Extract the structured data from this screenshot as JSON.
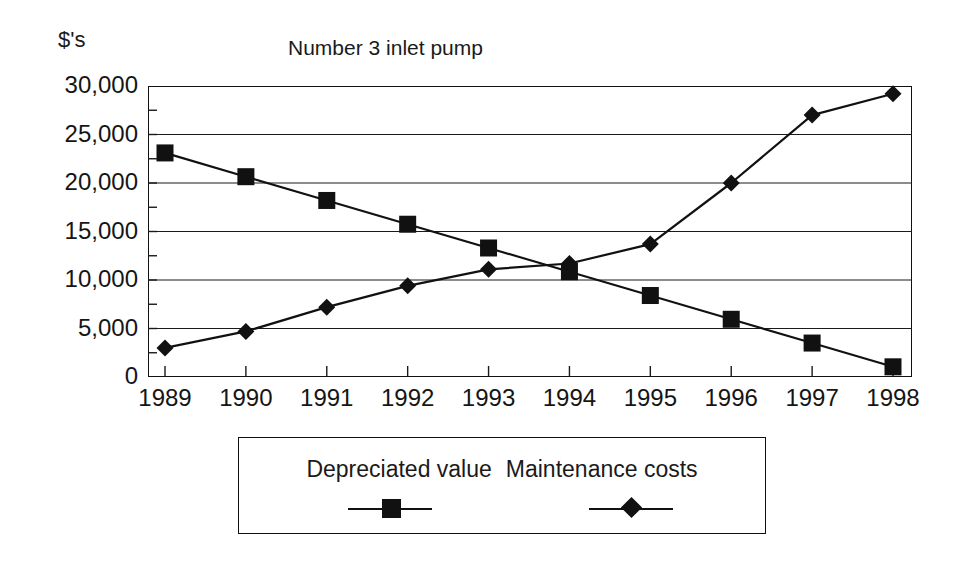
{
  "chart_data": {
    "type": "line",
    "title": "Number 3 inlet pump",
    "xlabel": "",
    "ylabel": "$'s",
    "ylim": [
      0,
      30000
    ],
    "xlim": [
      1989,
      1998
    ],
    "grid": true,
    "legend_position": "bottom",
    "categories": [
      "1989",
      "1990",
      "1991",
      "1992",
      "1993",
      "1994",
      "1995",
      "1996",
      "1997",
      "1998"
    ],
    "y_ticks": [
      "0",
      "5,000",
      "10,000",
      "15,000",
      "20,000",
      "25,000",
      "30,000"
    ],
    "y_tick_values": [
      0,
      5000,
      10000,
      15000,
      20000,
      25000,
      30000
    ],
    "series": [
      {
        "name": "Depreciated value",
        "marker": "square",
        "color": "#111111",
        "values": [
          23100,
          20650,
          18200,
          15750,
          13300,
          10850,
          8400,
          5950,
          3500,
          1050
        ]
      },
      {
        "name": "Maintenance costs",
        "marker": "diamond",
        "color": "#111111",
        "values": [
          3000,
          4700,
          7200,
          9400,
          11100,
          11700,
          13700,
          20000,
          27000,
          29200
        ]
      }
    ]
  },
  "axis": {
    "y_unit_label": "$'s"
  },
  "legend": {
    "entries": [
      {
        "label": "Depreciated value",
        "marker": "square"
      },
      {
        "label": "Maintenance costs",
        "marker": "diamond"
      }
    ]
  }
}
